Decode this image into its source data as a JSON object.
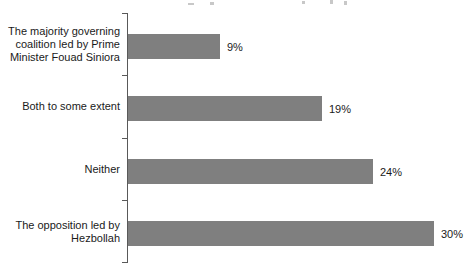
{
  "chart_data": {
    "type": "bar",
    "orientation": "horizontal",
    "title": "",
    "cropped_title_remnant": true,
    "categories": [
      "The majority governing coalition led by Prime Minister Fouad Siniora",
      "Both to some extent",
      "Neither",
      "The opposition led by Hezbollah"
    ],
    "category_lines": [
      [
        "The majority governing",
        "coalition led by Prime",
        "Minister Fouad Siniora"
      ],
      [
        "Both to some extent"
      ],
      [
        "Neither"
      ],
      [
        "The opposition led by",
        "Hezbollah"
      ]
    ],
    "values": [
      9,
      19,
      24,
      30
    ],
    "value_labels": [
      "9%",
      "19%",
      "24%",
      "30%"
    ],
    "xlim": [
      0,
      33.5
    ],
    "xlabel": "",
    "ylabel": "",
    "grid": false,
    "legend": false,
    "data_labels_position": "outside-end",
    "bar_color": "#7f7f7f",
    "axis_color": "#595959",
    "text_color": "#1a1a1a",
    "background_color": "#ffffff"
  }
}
